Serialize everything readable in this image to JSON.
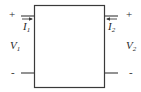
{
  "diagram": {
    "type": "two-port network",
    "colors": {
      "line": "#3a3a3a",
      "background": "#ffffff",
      "text": "#2a2a2a"
    },
    "port1": {
      "plus": "+",
      "minus": "-",
      "current": {
        "symbol": "I",
        "subscript": "1",
        "direction": "into box (right)"
      },
      "voltage": {
        "symbol": "V",
        "subscript": "1"
      }
    },
    "port2": {
      "plus": "+",
      "minus": "-",
      "current": {
        "symbol": "I",
        "subscript": "2",
        "direction": "into box (left)"
      },
      "voltage": {
        "symbol": "V",
        "subscript": "2"
      }
    }
  }
}
